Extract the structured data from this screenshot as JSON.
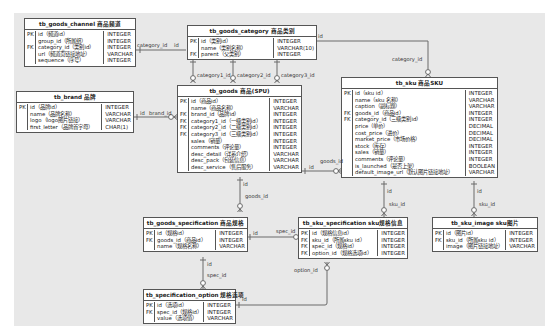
{
  "diagram": {
    "entities": {
      "channel": {
        "title": "tb_goods_channel 商品频道",
        "keys": [
          "PK",
          "",
          "FK",
          "",
          ""
        ],
        "names": [
          "id（频道id）",
          "group_id（所属组）",
          "category_id（类别id）",
          "url（频道页链接地址）",
          "sequence（序号）"
        ],
        "types": [
          "INTEGER",
          "INTEGER",
          "INTEGER",
          "VARCHAR",
          "INTEGER"
        ]
      },
      "category": {
        "title": "tb_goods_category 商品类别",
        "keys": [
          "PK",
          "",
          "FK"
        ],
        "names": [
          "id（类别id）",
          "name（类别名称）",
          "parent（父类别）"
        ],
        "types": [
          "INTEGER",
          "VARCHAR(10)",
          "INTEGER"
        ]
      },
      "brand": {
        "title": "tb_brand 品牌",
        "keys": [
          "PK",
          "",
          "",
          ""
        ],
        "names": [
          "id（品牌id）",
          "name（品牌名称）",
          "logo（logo图片链接）",
          "first_letter（品牌首字母）"
        ],
        "types": [
          "INTEGER",
          "VARCHAR",
          "VARCHAR",
          "CHAR(1)"
        ]
      },
      "goods": {
        "title": "tb_goods 商品(SPU)",
        "keys": [
          "PK",
          "",
          "FK",
          "FK",
          "FK",
          "FK",
          "",
          "",
          "",
          "",
          ""
        ],
        "names": [
          "id（商品id）",
          "name（商品名称）",
          "brand_id（品牌id）",
          "category1_id（一级类别id）",
          "category2_id（二级类别id）",
          "category3_id（三级类别id）",
          "sales（销量）",
          "comments（评论量）",
          "desc_detail（详系介绍）",
          "desc_pack（包装信息）",
          "desc_service（售后服务）"
        ],
        "types": [
          "INTEGER",
          "VARCHAR",
          "INTEGER",
          "INTEGER",
          "INTEGER",
          "INTEGER",
          "INTEGER",
          "INTEGER",
          "VARCHAR",
          "VARCHAR",
          "VARCHAR"
        ]
      },
      "sku": {
        "title": "tb_sku 商品SKU",
        "keys": [
          "PK",
          "",
          "",
          "FK",
          "FK",
          "",
          "",
          "",
          "",
          "",
          "",
          "",
          ""
        ],
        "names": [
          "id（sku id）",
          "name（sku 名称）",
          "caption（副标题）",
          "goods_id（商品id）",
          "category_id（三级类别id）",
          "price（单价）",
          "cost_price（进价）",
          "market_price（市场价格）",
          "stock（库存）",
          "sales（销量）",
          "comments（评论量）",
          "is_launched（是否上架）",
          "default_image_url（默认图片链接地址）"
        ],
        "types": [
          "INTEGER",
          "VARCHAR",
          "VARCHAR",
          "INTEGER",
          "INTEGER",
          "DECIMAL",
          "DECIMAL",
          "DECIMAL",
          "INTEGER",
          "INTEGER",
          "INTEGER",
          "BOOLEAN",
          "VARCHAR"
        ]
      },
      "goods_spec": {
        "title": "tb_goods_specification 商品规格",
        "keys": [
          "PK",
          "FK",
          ""
        ],
        "names": [
          "id（规格id）",
          "goods_id（商品id）",
          "name（规格名称）"
        ],
        "types": [
          "INTEGER",
          "INTEGER",
          "VARCHAR"
        ]
      },
      "sku_spec": {
        "title": "tb_sku_specification sku规格信息",
        "keys": [
          "PK",
          "FK",
          "FK",
          "FK"
        ],
        "names": [
          "id（规格信息id）",
          "sku_id（所属sku id）",
          "spec_id（规格id）",
          "option_id（规格选项id）"
        ],
        "types": [
          "INTEGER",
          "INTEGER",
          "INTEGER",
          "INTEGER"
        ]
      },
      "sku_image": {
        "title": "tb_sku_image sku图片",
        "keys": [
          "PK",
          "FK",
          ""
        ],
        "names": [
          "id（图片id）",
          "sku_id（所属sku id）",
          "image（图片链接地址）"
        ],
        "types": [
          "INTEGER",
          "INTEGER",
          "VARCHAR"
        ]
      },
      "spec_option": {
        "title": "tb_specification_option 规格选项",
        "keys": [
          "PK",
          "FK",
          ""
        ],
        "names": [
          "id（选项id）",
          "spec_id（规格id）",
          "value（选项值）"
        ],
        "types": [
          "INTEGER",
          "INTEGER",
          "VARCHAR"
        ]
      }
    },
    "labels": {
      "channel_category_fk": "category_id",
      "channel_category_pk": "id",
      "category_sku_pk": "id",
      "category_sku_fk": "category_id",
      "cat1": "category1_id",
      "cat2": "category2_id",
      "cat3": "category3_id",
      "brand_pk": "id",
      "brand_fk": "brand_id",
      "goods_sku_pk": "id",
      "goods_sku_fk": "goods_id",
      "goods_spec_pk": "id",
      "goods_spec_fk": "goods_id",
      "sku_skuspec_pk": "id",
      "sku_skuspec_fk": "sku_id",
      "sku_image_pk": "id",
      "sku_image_fk": "sku_id",
      "spec_skuspec_pk": "id",
      "spec_skuspec_fk": "spec_id",
      "spec_option_pk": "id",
      "spec_option_fk": "spec_id",
      "option_skuspec_pk": "id",
      "option_skuspec_fk": "option_id"
    }
  }
}
